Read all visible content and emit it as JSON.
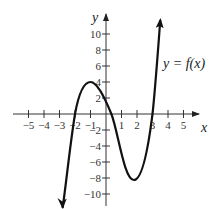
{
  "chart_data": {
    "type": "line",
    "title": "",
    "xlabel": "x",
    "ylabel": "y",
    "function_label": "y = f(x)",
    "xlim": [
      -5.5,
      5.9
    ],
    "ylim": [
      -11.5,
      12
    ],
    "grid": false,
    "x_ticks": [
      -5,
      -4,
      -3,
      -2,
      -1,
      1,
      2,
      3,
      4,
      5
    ],
    "x_tick_labels": [
      "−5",
      "−4",
      "−3",
      "−2",
      "−1",
      "1",
      "2",
      "3",
      "4",
      "5"
    ],
    "y_ticks": [
      10,
      8,
      6,
      4,
      2,
      -2,
      -4,
      -6,
      -8,
      -10
    ],
    "y_tick_labels": [
      "10",
      "8",
      "6",
      "4",
      "2",
      "−2",
      "−4",
      "−6",
      "−8",
      "−10"
    ],
    "series": [
      {
        "name": "f(x)",
        "description": "cubic-like curve, arrows at both ends",
        "key_points": [
          {
            "x": -2.8,
            "y": -11.8,
            "note": "downward arrow end"
          },
          {
            "x": -2,
            "y": 0,
            "note": "x-intercept"
          },
          {
            "x": -1,
            "y": 4,
            "note": "local maximum"
          },
          {
            "x": 0.35,
            "y": 0,
            "note": "x-intercept"
          },
          {
            "x": 1.8,
            "y": -8.3,
            "note": "local minimum"
          },
          {
            "x": 3,
            "y": 0,
            "note": "x-intercept"
          },
          {
            "x": 3.5,
            "y": 11.7,
            "note": "upward arrow end"
          }
        ]
      }
    ]
  }
}
